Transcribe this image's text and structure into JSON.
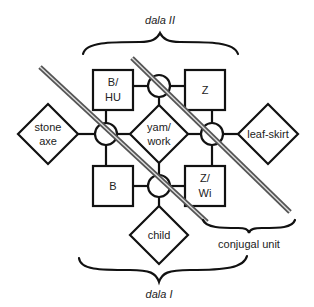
{
  "diagram": {
    "labels": {
      "dala_ii": "dala II",
      "dala_i": "dala I",
      "conjugal_unit": "conjugal unit"
    },
    "boxes": [
      {
        "id": "b-hu",
        "line1": "B/",
        "line2": "HU"
      },
      {
        "id": "z",
        "line1": "Z",
        "line2": ""
      },
      {
        "id": "b",
        "line1": "B",
        "line2": ""
      },
      {
        "id": "z-wi",
        "line1": "Z/",
        "line2": "Wi"
      }
    ],
    "diamonds": [
      {
        "id": "yam-work",
        "line1": "yam/",
        "line2": "work"
      },
      {
        "id": "stone-axe",
        "line1": "stone",
        "line2": "axe"
      },
      {
        "id": "leaf-skirt",
        "line1": "leaf-skirt",
        "line2": ""
      },
      {
        "id": "child",
        "line1": "child",
        "line2": ""
      }
    ],
    "circles": [
      "top",
      "left",
      "right",
      "bottom"
    ],
    "colors": {
      "line": "#111111",
      "hatch": "#555555",
      "background": "#ffffff"
    }
  }
}
